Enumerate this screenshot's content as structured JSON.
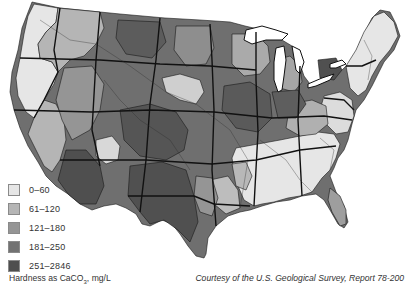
{
  "map": {
    "title": "Water hardness in the United States",
    "legend_items": [
      {
        "label": "0–60",
        "color": "#e6e6e6"
      },
      {
        "label": "61–120",
        "color": "#b5b5b5"
      },
      {
        "label": "121–180",
        "color": "#959595"
      },
      {
        "label": "181–250",
        "color": "#727272"
      },
      {
        "label": "251–2846",
        "color": "#4f4f4f"
      }
    ],
    "units_label_prefix": "Hardness as CaCO",
    "units_subscript": "3",
    "units_label_suffix": ", mg/L",
    "credit": "Courtesy of the U.S. Geological Survey, Report 78-200"
  }
}
